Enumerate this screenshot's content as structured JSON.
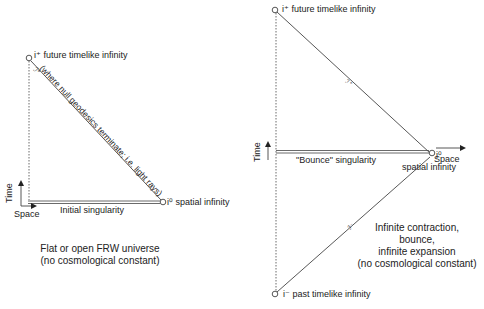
{
  "left_diagram": {
    "future_infinity": "i⁺ future timelike infinity",
    "null_infinity": "ℐ⁺",
    "null_note": "(where null geodesics terminate; i.e. light rays)",
    "spatial_infinity": "i⁰ spatial infinity",
    "singularity": "Initial singularity",
    "axis_time": "Time",
    "axis_space": "Space",
    "caption_line1": "Flat or open FRW universe",
    "caption_line2": "(no cosmological constant)"
  },
  "right_diagram": {
    "future_infinity": "i⁺ future timelike infinity",
    "past_infinity": "i⁻ past timelike infinity",
    "null_future": "ℐ⁺",
    "null_past": "ℐ⁻",
    "spatial_infinity_sym": "i⁰",
    "spatial_infinity_text": "spatial infinity",
    "singularity": "\"Bounce\" singularity",
    "axis_time": "Time",
    "axis_space": "Space",
    "caption_line1": "Infinite contraction,",
    "caption_line2": "bounce,",
    "caption_line3": "infinite expansion",
    "caption_line4": "(no cosmological constant)"
  }
}
